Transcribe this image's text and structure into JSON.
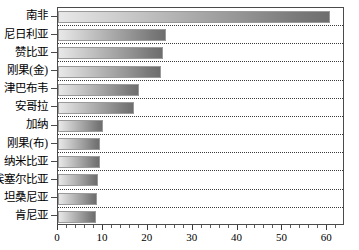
{
  "chart_data": {
    "type": "bar",
    "orientation": "horizontal",
    "title": "",
    "xlabel": "",
    "ylabel": "",
    "xlim": [
      0,
      63.5
    ],
    "xticks": [
      0,
      10,
      20,
      30,
      40,
      50,
      60
    ],
    "xtick_labels": [
      "0",
      "10",
      "20",
      "30",
      "40",
      "50",
      "60"
    ],
    "minor_tick_step": 2,
    "grid": "horizontal-dotted-separators",
    "legend": "none",
    "bar_style": "gradient-light-to-dark-gray",
    "categories": [
      "南非",
      "尼日利亚",
      "赞比亚",
      "刚果(金)",
      "津巴布韦",
      "安哥拉",
      "加纳",
      "刚果(布)",
      "纳米比亚",
      "埃塞尔比亚",
      "坦桑尼亚",
      "肯尼亚"
    ],
    "values": [
      60.5,
      24.0,
      23.5,
      23.0,
      18.0,
      17.0,
      10.0,
      9.3,
      9.3,
      8.9,
      8.7,
      8.4
    ]
  },
  "colors": {
    "bar_light": "#e8e8e8",
    "bar_dark": "#6e6e6e",
    "axis": "#4a4a4a",
    "gridline": "#3a3a3a",
    "text": "#000000",
    "background": "#ffffff"
  }
}
